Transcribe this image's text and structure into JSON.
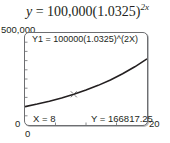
{
  "equation": {
    "lhs": "y",
    "rhs_base": " = 100,000(1.0325)",
    "exponent": "2x"
  },
  "window": {
    "ymax_label": "500,000",
    "ymin_label": "0",
    "xmin_label": "0",
    "xmax_label": "20"
  },
  "screen": {
    "function_readout": "Y1 = 100000(1.0325)^(2X)",
    "x_readout": "X = 8",
    "y_readout": "Y = 166817.25"
  },
  "chart_data": {
    "type": "line",
    "xlabel": "",
    "ylabel": "",
    "xlim": [
      0,
      20
    ],
    "ylim": [
      0,
      500000
    ],
    "grid": false,
    "axis_ticks": {
      "x_tick_count": 4,
      "y_tick_count": 10
    },
    "series": [
      {
        "name": "Y1 = 100000(1.0325)^(2X)",
        "x": [
          0,
          2,
          4,
          6,
          8,
          10,
          12,
          14,
          16,
          18,
          20
        ],
        "values": [
          100000,
          113648.1,
          129159.0,
          146786.8,
          166817.25,
          189583.6,
          215457.3,
          244862.3,
          278276.1,
          316252.1,
          359411.1
        ]
      }
    ],
    "trace_point": {
      "x": 8,
      "y": 166817.25,
      "label_x": "X = 8",
      "label_y": "Y = 166817.25"
    },
    "annotations": [
      "Y1 = 100000(1.0325)^(2X)",
      "X = 8",
      "Y = 166817.25"
    ]
  }
}
